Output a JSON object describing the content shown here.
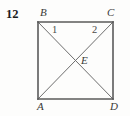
{
  "figure": {
    "problem_number": "12",
    "vertices": {
      "top_left": "B",
      "top_right": "C",
      "bottom_left": "A",
      "bottom_right": "D",
      "center": "E"
    },
    "angle_labels": {
      "left": "1",
      "right": "2"
    },
    "colors": {
      "background": "#fdfdfc",
      "square_stroke": "#5a5a5a",
      "diagonal_stroke": "#6e6e6e",
      "label_text": "#3a3a38",
      "number_text": "#1c1c1c"
    },
    "geometry": {
      "left": 38,
      "right": 113,
      "top": 22,
      "bottom": 99,
      "center_x": 75.5,
      "center_y": 60.5
    }
  }
}
